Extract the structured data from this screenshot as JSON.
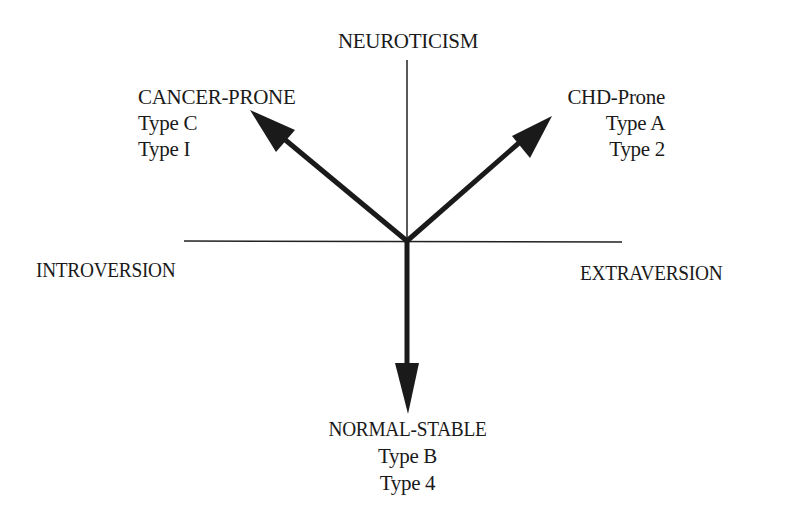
{
  "diagram": {
    "axes": {
      "vertical_top": "NEUROTICISM",
      "horizontal_left": "INTROVERSION",
      "horizontal_right": "EXTRAVERSION"
    },
    "quadrants": {
      "upper_left": {
        "lines": [
          "CANCER-PRONE",
          "Type C",
          "Type I"
        ]
      },
      "upper_right": {
        "lines": [
          "CHD-Prone",
          "Type A",
          "Type 2"
        ]
      },
      "bottom": {
        "lines": [
          "NORMAL-STABLE",
          "Type B",
          "Type 4"
        ]
      }
    },
    "arrows": [
      {
        "name": "to-cancer-prone",
        "from": [
          407,
          241
        ],
        "to": [
          250,
          110
        ]
      },
      {
        "name": "to-chd-prone",
        "from": [
          407,
          241
        ],
        "to": [
          551,
          116
        ]
      },
      {
        "name": "to-normal-stable",
        "from": [
          407,
          241
        ],
        "to": [
          407,
          413
        ]
      }
    ],
    "colors": {
      "ink": "#1a1a1a",
      "background": "#ffffff"
    }
  }
}
